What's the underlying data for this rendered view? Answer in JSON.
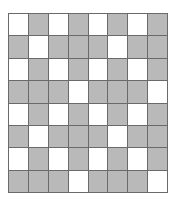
{
  "grid": {
    "rows": 8,
    "cols": 8,
    "colors": {
      "filled": "#b9b9b9",
      "empty": "#ffffff",
      "line": "#6a6a6a"
    },
    "cells": [
      [
        0,
        1,
        0,
        1,
        0,
        1,
        0,
        1
      ],
      [
        1,
        0,
        1,
        1,
        1,
        0,
        1,
        1
      ],
      [
        0,
        1,
        0,
        1,
        0,
        1,
        0,
        1
      ],
      [
        1,
        1,
        1,
        0,
        1,
        1,
        1,
        0
      ],
      [
        0,
        1,
        0,
        1,
        0,
        1,
        0,
        1
      ],
      [
        1,
        0,
        1,
        1,
        1,
        0,
        1,
        1
      ],
      [
        0,
        1,
        0,
        1,
        0,
        1,
        0,
        1
      ],
      [
        1,
        1,
        1,
        0,
        1,
        1,
        1,
        0
      ]
    ]
  }
}
